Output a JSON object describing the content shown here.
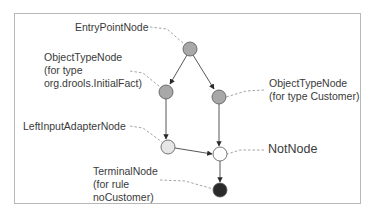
{
  "diagram": {
    "type": "rete-network",
    "frame_color": "#b8b8b8",
    "edge_color": "#444444",
    "leader_color": "#9a9a9a",
    "nodes": [
      {
        "id": "entry",
        "x": 190,
        "y": 49,
        "r": 7,
        "fill": "#a8a8a8"
      },
      {
        "id": "otn_initial",
        "x": 166,
        "y": 92,
        "r": 7,
        "fill": "#a8a8a8"
      },
      {
        "id": "otn_customer",
        "x": 219,
        "y": 97,
        "r": 7,
        "fill": "#a8a8a8"
      },
      {
        "id": "lia",
        "x": 168,
        "y": 147,
        "r": 7,
        "fill": "#e6e6e6"
      },
      {
        "id": "not",
        "x": 220,
        "y": 154,
        "r": 7,
        "fill": "#ffffff"
      },
      {
        "id": "terminal",
        "x": 220,
        "y": 190,
        "r": 7,
        "fill": "#2a2a2a"
      }
    ],
    "edges": [
      {
        "from": "entry",
        "to": "otn_initial"
      },
      {
        "from": "entry",
        "to": "otn_customer"
      },
      {
        "from": "otn_initial",
        "to": "lia"
      },
      {
        "from": "otn_customer",
        "to": "not"
      },
      {
        "from": "lia",
        "to": "not"
      },
      {
        "from": "not",
        "to": "terminal"
      }
    ],
    "labels": {
      "entry": {
        "lines": [
          "EntryPointNode"
        ]
      },
      "otn_initial": {
        "lines": [
          "ObjectTypeNode",
          "(for type",
          "org.drools.InitialFact)"
        ]
      },
      "otn_customer": {
        "lines": [
          "ObjectTypeNode",
          "(for type Customer)"
        ]
      },
      "lia": {
        "lines": [
          "LeftInputAdapterNode"
        ]
      },
      "not": {
        "lines": [
          "NotNode"
        ]
      },
      "terminal": {
        "lines": [
          "TerminalNode",
          "(for rule",
          "noCustomer)"
        ]
      }
    }
  }
}
